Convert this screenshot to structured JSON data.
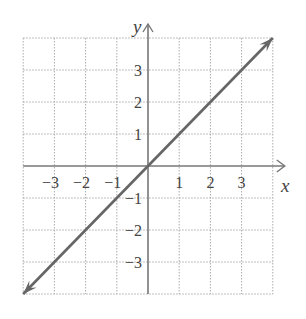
{
  "chart_data": {
    "type": "line",
    "title": "",
    "xlabel": "x",
    "ylabel": "y",
    "xlim": [
      -4,
      4
    ],
    "ylim": [
      -4,
      4
    ],
    "grid": true,
    "grid_style": "dotted",
    "x_ticks": [
      -3,
      -2,
      -1,
      1,
      2,
      3
    ],
    "y_ticks": [
      -3,
      -2,
      -1,
      1,
      2,
      3
    ],
    "x_tick_labels": [
      "−3",
      "−2",
      "−1",
      "1",
      "2",
      "3"
    ],
    "y_tick_labels": [
      "−3",
      "−2",
      "−1",
      "1",
      "2",
      "3"
    ],
    "series": [
      {
        "name": "y = x",
        "x": [
          -4,
          4
        ],
        "y": [
          -4,
          4
        ],
        "arrows_both_ends": true,
        "color": "#666666"
      }
    ],
    "legend": null
  },
  "colors": {
    "axis": "#777777",
    "grid": "#aaaaaa",
    "line": "#666666"
  }
}
